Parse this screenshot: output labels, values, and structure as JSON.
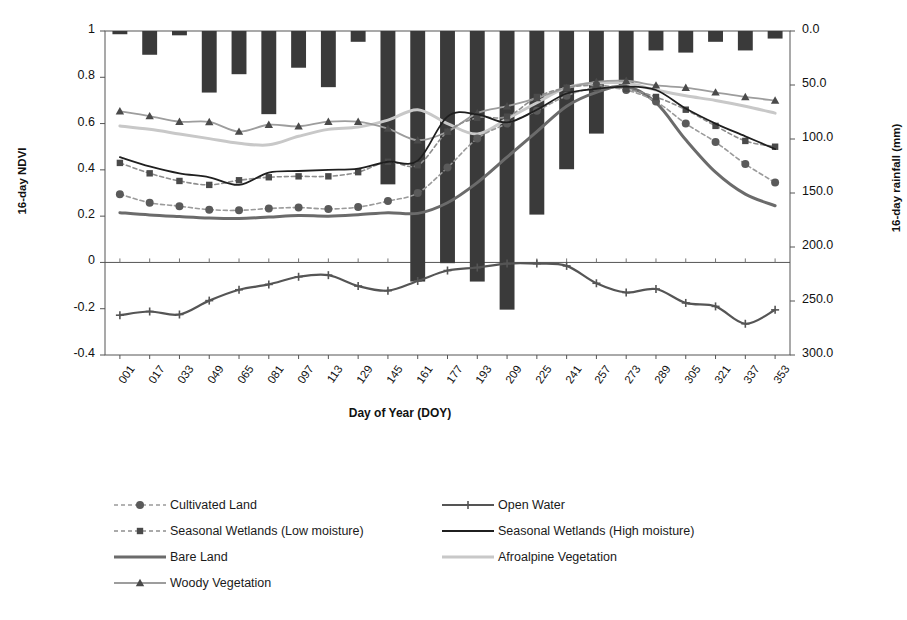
{
  "chart_data": {
    "type": "line",
    "title": "",
    "xlabel": "Day of Year (DOY)",
    "ylabel": "16-day NDVI",
    "y2label": "16-day rainfall (mm)",
    "ylim": [
      -0.4,
      1.0
    ],
    "yticks": [
      "1",
      "0.8",
      "0.6",
      "0.4",
      "0.2",
      "0",
      "-0.2",
      "-0.4"
    ],
    "ytickvals": [
      1,
      0.8,
      0.6,
      0.4,
      0.2,
      0,
      -0.2,
      -0.4
    ],
    "y2lim": [
      0.0,
      300.0
    ],
    "y2_inverted": true,
    "y2ticks": [
      "0.0",
      "50.0",
      "100.0",
      "150.0",
      "200.0",
      "250.0",
      "300.0"
    ],
    "y2tickvals": [
      0,
      50,
      100,
      150,
      200,
      250,
      300
    ],
    "grid": false,
    "legend_position": "bottom",
    "categories": [
      "001",
      "017",
      "033",
      "049",
      "065",
      "081",
      "097",
      "113",
      "129",
      "145",
      "161",
      "177",
      "193",
      "209",
      "225",
      "241",
      "257",
      "273",
      "289",
      "305",
      "321",
      "337",
      "353"
    ],
    "bars": {
      "name": "16-day rainfall",
      "axis": "y2",
      "color": "#3a3a3a",
      "values": [
        3,
        22,
        4,
        57,
        40,
        77,
        34,
        52,
        10,
        142,
        232,
        215,
        232,
        258,
        170,
        128,
        95,
        50,
        18,
        20,
        10,
        18,
        7
      ]
    },
    "series": [
      {
        "name": "Cultivated Land",
        "color": "#9a9a9a",
        "marker": "circle",
        "marker_color": "#5a5a5a",
        "dash": "4 3",
        "width": 1.6,
        "values": [
          0.295,
          0.258,
          0.243,
          0.228,
          0.225,
          0.233,
          0.237,
          0.231,
          0.239,
          0.265,
          0.3,
          0.41,
          0.535,
          0.6,
          0.655,
          0.72,
          0.755,
          0.745,
          0.695,
          0.6,
          0.52,
          0.425,
          0.345
        ]
      },
      {
        "name": "Seasonal Wetlands (Low moisture)",
        "color": "#8e8e8e",
        "marker": "square",
        "marker_color": "#4a4a4a",
        "dash": "4 3",
        "width": 1.6,
        "values": [
          0.43,
          0.385,
          0.352,
          0.335,
          0.355,
          0.368,
          0.372,
          0.372,
          0.39,
          0.435,
          0.42,
          0.565,
          0.625,
          0.63,
          0.715,
          0.755,
          0.765,
          0.75,
          0.715,
          0.66,
          0.59,
          0.525,
          0.5
        ]
      },
      {
        "name": "Bare Land",
        "color": "#6b6b6b",
        "marker": "none",
        "dash": "",
        "width": 3.0,
        "values": [
          0.215,
          0.205,
          0.198,
          0.192,
          0.19,
          0.196,
          0.203,
          0.2,
          0.206,
          0.215,
          0.212,
          0.258,
          0.345,
          0.455,
          0.565,
          0.675,
          0.735,
          0.76,
          0.69,
          0.53,
          0.39,
          0.295,
          0.245
        ]
      },
      {
        "name": "Woody Vegetation",
        "color": "#9d9d9d",
        "marker": "triangle",
        "marker_color": "#4a4a4a",
        "dash": "",
        "width": 1.8,
        "values": [
          0.653,
          0.632,
          0.608,
          0.607,
          0.565,
          0.595,
          0.588,
          0.608,
          0.608,
          0.578,
          0.528,
          0.565,
          0.645,
          0.675,
          0.71,
          0.755,
          0.78,
          0.785,
          0.765,
          0.755,
          0.735,
          0.715,
          0.7
        ]
      },
      {
        "name": "Open Water",
        "color": "#555555",
        "marker": "plus",
        "marker_color": "#555555",
        "dash": "",
        "width": 2.2,
        "values": [
          -0.228,
          -0.212,
          -0.225,
          -0.165,
          -0.118,
          -0.095,
          -0.062,
          -0.055,
          -0.102,
          -0.122,
          -0.08,
          -0.035,
          -0.022,
          -0.005,
          -0.005,
          -0.015,
          -0.09,
          -0.13,
          -0.115,
          -0.175,
          -0.19,
          -0.265,
          -0.205
        ]
      },
      {
        "name": "Seasonal Wetlands (High moisture)",
        "color": "#1f1f1f",
        "marker": "none",
        "dash": "",
        "width": 1.8,
        "values": [
          0.455,
          0.415,
          0.385,
          0.368,
          0.335,
          0.388,
          0.395,
          0.4,
          0.405,
          0.435,
          0.44,
          0.63,
          0.64,
          0.605,
          0.66,
          0.73,
          0.75,
          0.76,
          0.745,
          0.665,
          0.6,
          0.545,
          0.49
        ]
      },
      {
        "name": "Afroalpine Vegetation",
        "color": "#c8c8c8",
        "marker": "none",
        "dash": "",
        "width": 3.0,
        "values": [
          0.59,
          0.575,
          0.555,
          0.535,
          0.515,
          0.508,
          0.545,
          0.575,
          0.585,
          0.615,
          0.66,
          0.6,
          0.555,
          0.62,
          0.69,
          0.755,
          0.775,
          0.775,
          0.745,
          0.72,
          0.7,
          0.675,
          0.645
        ]
      }
    ]
  },
  "legend": {
    "items": [
      {
        "label": "Cultivated Land",
        "style": "dashed-circle"
      },
      {
        "label": "Open Water",
        "style": "solid-plus"
      },
      {
        "label": "Seasonal Wetlands (Low moisture)",
        "style": "dashed-square"
      },
      {
        "label": "Seasonal Wetlands (High moisture)",
        "style": "solid-black"
      },
      {
        "label": "Bare Land",
        "style": "solid-thick-gray"
      },
      {
        "label": "Afroalpine Vegetation",
        "style": "solid-light"
      },
      {
        "label": "Woody Vegetation",
        "style": "solid-triangle"
      }
    ]
  },
  "colors": {
    "bar": "#3a3a3a",
    "axis": "#555555",
    "text": "#111111"
  }
}
